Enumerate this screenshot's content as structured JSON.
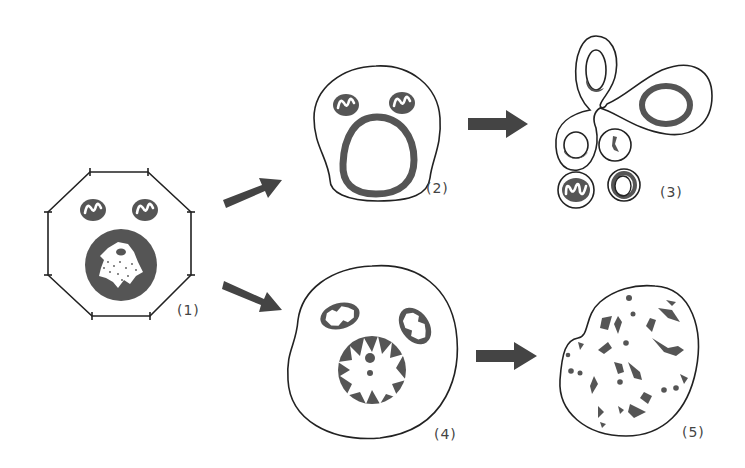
{
  "diagram": {
    "type": "cell-death-pathways",
    "colors": {
      "stroke": "#222222",
      "fill_dark": "#555555",
      "arrow": "#444444",
      "background": "#ffffff"
    },
    "stages": [
      {
        "id": 1,
        "label": "(1)",
        "description": "normal cell with two mitochondria and nucleus"
      },
      {
        "id": 2,
        "label": "(2)",
        "description": "cell shrinkage with condensed nuclear envelope"
      },
      {
        "id": 3,
        "label": "(3)",
        "description": "cell fragmentation into membrane-bound bodies"
      },
      {
        "id": 4,
        "label": "(4)",
        "description": "swollen cell with swollen mitochondria and disrupted nucleus"
      },
      {
        "id": 5,
        "label": "(5)",
        "description": "ruptured cell with scattered debris"
      }
    ],
    "arrows": [
      {
        "from": 1,
        "to": 2
      },
      {
        "from": 1,
        "to": 4
      },
      {
        "from": 2,
        "to": 3
      },
      {
        "from": 4,
        "to": 5
      }
    ]
  }
}
